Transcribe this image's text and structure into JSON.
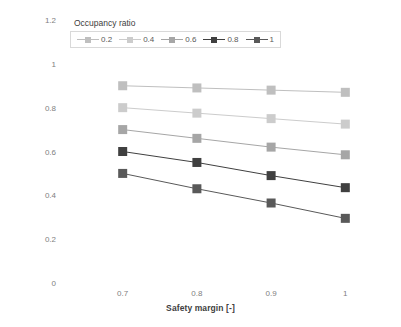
{
  "chart_data": {
    "type": "line",
    "title": "",
    "xlabel": "Safety margin [-]",
    "ylabel": "IT installed capacity credit [%]",
    "legend_title": "Occupancy ratio",
    "legend_position": "top-left-inside",
    "grid": false,
    "x": [
      0.7,
      0.8,
      0.9,
      1
    ],
    "x_tick_labels": [
      "0.7",
      "0.8",
      "0.9",
      "1"
    ],
    "xlim": [
      0.66,
      1.04
    ],
    "ylim": [
      0,
      1.2
    ],
    "y_tick_labels": [
      "0",
      "0.2",
      "0.4",
      "0.6",
      "0.8",
      "1",
      "1.2"
    ],
    "y_ticks": [
      0,
      0.2,
      0.4,
      0.6,
      0.8,
      1,
      1.2
    ],
    "series": [
      {
        "name": "0.2",
        "values": [
          0.9,
          0.89,
          0.88,
          0.87
        ],
        "color": "#bfbfbf"
      },
      {
        "name": "0.4",
        "values": [
          0.8,
          0.775,
          0.75,
          0.725
        ],
        "color": "#cccccc"
      },
      {
        "name": "0.6",
        "values": [
          0.7,
          0.66,
          0.62,
          0.585
        ],
        "color": "#a6a6a6"
      },
      {
        "name": "0.8",
        "values": [
          0.6,
          0.55,
          0.49,
          0.435
        ],
        "color": "#404040"
      },
      {
        "name": "1",
        "values": [
          0.5,
          0.43,
          0.365,
          0.295
        ],
        "color": "#595959"
      }
    ]
  },
  "axis": {
    "y_title": "IT installed capacity credit [%]",
    "x_title": "Safety margin [-]"
  }
}
